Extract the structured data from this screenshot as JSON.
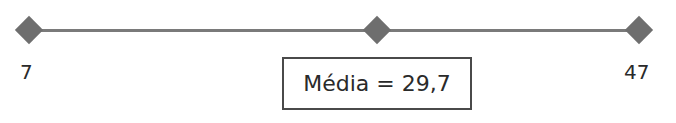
{
  "diagram": {
    "type": "number-line",
    "points": [
      {
        "name": "min",
        "value": 7,
        "label": "7",
        "x": 29
      },
      {
        "name": "mean",
        "value": 29.7,
        "label": "",
        "x": 377
      },
      {
        "name": "max",
        "value": 47,
        "label": "47",
        "x": 639
      }
    ],
    "mean_box": {
      "text": "Média = 29,7"
    },
    "colors": {
      "line": "#7a7a7a",
      "marker": "#6e6e6e",
      "box_border": "#4a4a4a"
    }
  }
}
